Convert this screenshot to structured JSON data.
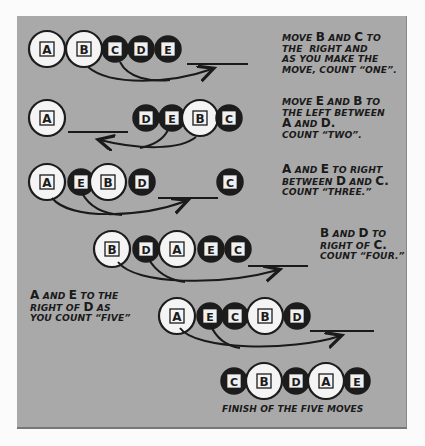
{
  "diagram": {
    "colors": {
      "panel": "#a9a9a9",
      "page": "#fbfbfb",
      "ink": "#1a1a1a",
      "white_coin": "#f4f4f4",
      "dark_coin": "#1c1c1c"
    },
    "coin_types": {
      "A": "large-white",
      "B": "large-white",
      "C": "small-black",
      "D": "small-black",
      "E": "small-black"
    },
    "steps": [
      {
        "order": [
          "A",
          "B",
          "C",
          "D",
          "E"
        ],
        "moved": [
          "B",
          "C"
        ],
        "instruction_lines": [
          "MOVE B AND C TO",
          "THE RIGHT AND",
          "AS YOU MAKE THE",
          "MOVE, COUNT \"ONE\"."
        ]
      },
      {
        "order": [
          "A",
          "D",
          "E",
          "B",
          "C"
        ],
        "moved": [
          "E",
          "B"
        ],
        "instruction_lines": [
          "MOVE E AND B TO",
          "THE LEFT BETWEEN",
          "A AND D.",
          "COUNT \"TWO\"."
        ]
      },
      {
        "order": [
          "A",
          "E",
          "B",
          "D",
          "C"
        ],
        "moved": [
          "A",
          "E"
        ],
        "instruction_lines": [
          "A AND E TO RIGHT",
          "BETWEEN D AND C.",
          "COUNT \"THREE.\""
        ]
      },
      {
        "order": [
          "B",
          "D",
          "A",
          "E",
          "C"
        ],
        "moved": [
          "B",
          "D"
        ],
        "instruction_lines": [
          "B AND D TO",
          "RIGHT OF C.",
          "COUNT \"FOUR.\""
        ]
      },
      {
        "order": [
          "A",
          "E",
          "C",
          "B",
          "D"
        ],
        "moved": [
          "A",
          "E"
        ],
        "instruction_lines": [
          "A AND E TO THE",
          "RIGHT OF D AS",
          "YOU COUNT \"FIVE\""
        ]
      },
      {
        "order": [
          "C",
          "B",
          "D",
          "A",
          "E"
        ],
        "moved": [],
        "instruction_lines": [
          "FINISH OF THE FIVE MOVES"
        ]
      }
    ]
  },
  "labels": {
    "step1": [
      "MOVE ",
      "B",
      " AND ",
      "C",
      " TO",
      "THE  RIGHT AND",
      "AS YOU MAKE THE",
      "MOVE, COUNT “ONE”."
    ],
    "step2": [
      "MOVE ",
      "E",
      " AND ",
      "B",
      " TO",
      "THE LEFT BETWEEN",
      "A",
      " AND ",
      "D",
      ".",
      "COUNT “TWO”."
    ],
    "step3": [
      "A",
      " AND ",
      "E",
      " TO RIGHT",
      "BETWEEN ",
      "D",
      " AND ",
      "C",
      ".",
      "COUNT “THREE.”"
    ],
    "step4": [
      "B",
      " AND ",
      "D",
      " TO",
      "RIGHT OF ",
      "C",
      ".",
      "COUNT “FOUR.”"
    ],
    "step5": [
      "A",
      " AND ",
      "E",
      " TO THE",
      "RIGHT OF ",
      "D",
      " AS",
      "YOU COUNT “FIVE”"
    ],
    "finish": "FINISH OF THE FIVE MOVES"
  },
  "coins": {
    "row1": [
      "A",
      "B",
      "C",
      "D",
      "E"
    ],
    "row2": [
      "A",
      "D",
      "E",
      "B",
      "C"
    ],
    "row3": [
      "A",
      "E",
      "B",
      "D",
      "C"
    ],
    "row4": [
      "B",
      "D",
      "A",
      "E",
      "C"
    ],
    "row5": [
      "A",
      "E",
      "C",
      "B",
      "D"
    ],
    "row6": [
      "C",
      "B",
      "D",
      "A",
      "E"
    ]
  }
}
